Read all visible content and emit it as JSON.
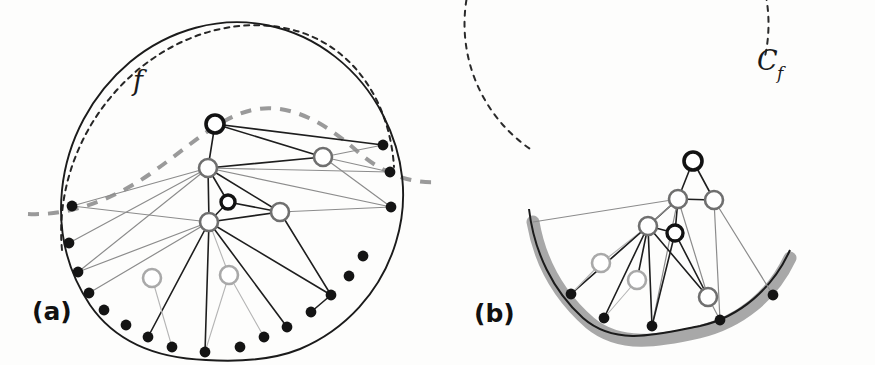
{
  "figure": {
    "width": 875,
    "height": 365,
    "background": "#fdfdfc",
    "caption_labels": {
      "panel_a": "(a)",
      "panel_b": "(b)"
    },
    "math_labels": {
      "curve_f": "f",
      "circle_c": "C",
      "circle_c_sub": "f"
    }
  },
  "colors": {
    "ink_black": "#111111",
    "node_black": "#121212",
    "node_gray_dark": "#6f6f6f",
    "node_gray_light": "#a9a9a9",
    "edge_black": "#1e1e1e",
    "edge_gray": "#8c8c8c",
    "edge_gray_light": "#b5b5b5",
    "dashed_black": "#262626",
    "dashed_gray": "#9a9a9a",
    "highlight_arc": "#a8a8a8",
    "boundary_dot": "#141414"
  },
  "panel_a": {
    "name": "closed-curve-with-internal-graph",
    "boundary_solid_path": "M 206 360 C 150 358 112 337 90 305 C 66 269 58 230 62 190 C 67 140 92 94 130 62 C 170 29 220 16 266 25 C 318 35 360 70 383 115 C 404 156 409 200 396 242 C 381 292 345 330 300 349 C 270 361 238 362 206 360 Z",
    "boundary_dots": [
      {
        "x": 72,
        "y": 206
      },
      {
        "x": 69,
        "y": 243
      },
      {
        "x": 78,
        "y": 272
      },
      {
        "x": 89,
        "y": 293
      },
      {
        "x": 104,
        "y": 310
      },
      {
        "x": 126,
        "y": 325
      },
      {
        "x": 148,
        "y": 337
      },
      {
        "x": 172,
        "y": 347
      },
      {
        "x": 205,
        "y": 352
      },
      {
        "x": 240,
        "y": 347
      },
      {
        "x": 264,
        "y": 337
      },
      {
        "x": 287,
        "y": 327
      },
      {
        "x": 311,
        "y": 312
      },
      {
        "x": 331,
        "y": 295
      },
      {
        "x": 349,
        "y": 276
      },
      {
        "x": 363,
        "y": 256
      },
      {
        "x": 391,
        "y": 207
      },
      {
        "x": 390,
        "y": 172
      },
      {
        "x": 383,
        "y": 145
      }
    ],
    "nodes": [
      {
        "id": "a1",
        "x": 215,
        "y": 124,
        "style": "black-ring",
        "r": 9
      },
      {
        "id": "a2",
        "x": 208,
        "y": 168,
        "style": "gray-ring",
        "r": 9
      },
      {
        "id": "a3",
        "x": 228,
        "y": 202,
        "style": "black-ring-small",
        "r": 7
      },
      {
        "id": "a4",
        "x": 209,
        "y": 222,
        "style": "gray-ring",
        "r": 9
      },
      {
        "id": "a5",
        "x": 323,
        "y": 157,
        "style": "gray-ring",
        "r": 9
      },
      {
        "id": "a6",
        "x": 280,
        "y": 212,
        "style": "gray-ring",
        "r": 9
      },
      {
        "id": "a7",
        "x": 152,
        "y": 278,
        "style": "lightgray-ring",
        "r": 9
      },
      {
        "id": "a8",
        "x": 229,
        "y": 275,
        "style": "lightgray-ring",
        "r": 9
      }
    ],
    "dashed_outer_curve": "M 62 250 C 56 186 82 120 132 75 C 182 30 247 15 300 32 C 356 50 390 104 394 167",
    "dashed_gray_curve": "M 28 214 C 70 216 112 200 150 174 C 190 146 218 118 252 110 C 292 101 330 127 358 152 C 382 173 410 184 438 182",
    "edges": [
      {
        "from": [
          215,
          124
        ],
        "to": [
          208,
          168
        ],
        "tone": "black"
      },
      {
        "from": [
          215,
          124
        ],
        "to": [
          323,
          157
        ],
        "tone": "black"
      },
      {
        "from": [
          215,
          124
        ],
        "to": [
          383,
          145
        ],
        "tone": "black"
      },
      {
        "from": [
          208,
          168
        ],
        "to": [
          323,
          157
        ],
        "tone": "black"
      },
      {
        "from": [
          208,
          168
        ],
        "to": [
          209,
          222
        ],
        "tone": "black"
      },
      {
        "from": [
          208,
          168
        ],
        "to": [
          228,
          202
        ],
        "tone": "black"
      },
      {
        "from": [
          208,
          168
        ],
        "to": [
          280,
          212
        ],
        "tone": "black"
      },
      {
        "from": [
          208,
          168
        ],
        "to": [
          391,
          207
        ],
        "tone": "gray"
      },
      {
        "from": [
          208,
          168
        ],
        "to": [
          390,
          172
        ],
        "tone": "gray"
      },
      {
        "from": [
          208,
          168
        ],
        "to": [
          72,
          206
        ],
        "tone": "gray"
      },
      {
        "from": [
          208,
          168
        ],
        "to": [
          69,
          243
        ],
        "tone": "gray"
      },
      {
        "from": [
          208,
          168
        ],
        "to": [
          78,
          272
        ],
        "tone": "gray"
      },
      {
        "from": [
          323,
          157
        ],
        "to": [
          383,
          145
        ],
        "tone": "gray"
      },
      {
        "from": [
          323,
          157
        ],
        "to": [
          390,
          172
        ],
        "tone": "gray"
      },
      {
        "from": [
          323,
          157
        ],
        "to": [
          391,
          207
        ],
        "tone": "gray"
      },
      {
        "from": [
          228,
          202
        ],
        "to": [
          280,
          212
        ],
        "tone": "black"
      },
      {
        "from": [
          209,
          222
        ],
        "to": [
          228,
          202
        ],
        "tone": "black"
      },
      {
        "from": [
          209,
          222
        ],
        "to": [
          280,
          212
        ],
        "tone": "black"
      },
      {
        "from": [
          280,
          212
        ],
        "to": [
          391,
          207
        ],
        "tone": "gray"
      },
      {
        "from": [
          280,
          212
        ],
        "to": [
          331,
          295
        ],
        "tone": "black"
      },
      {
        "from": [
          209,
          222
        ],
        "to": [
          331,
          295
        ],
        "tone": "black"
      },
      {
        "from": [
          209,
          222
        ],
        "to": [
          72,
          206
        ],
        "tone": "gray"
      },
      {
        "from": [
          209,
          222
        ],
        "to": [
          78,
          272
        ],
        "tone": "gray"
      },
      {
        "from": [
          209,
          222
        ],
        "to": [
          89,
          293
        ],
        "tone": "gray"
      },
      {
        "from": [
          209,
          222
        ],
        "to": [
          148,
          337
        ],
        "tone": "black"
      },
      {
        "from": [
          209,
          222
        ],
        "to": [
          205,
          352
        ],
        "tone": "black"
      },
      {
        "from": [
          209,
          222
        ],
        "to": [
          229,
          275
        ],
        "tone": "lightgray"
      },
      {
        "from": [
          209,
          222
        ],
        "to": [
          287,
          327
        ],
        "tone": "black"
      },
      {
        "from": [
          152,
          278
        ],
        "to": [
          172,
          347
        ],
        "tone": "lightgray"
      },
      {
        "from": [
          229,
          275
        ],
        "to": [
          205,
          352
        ],
        "tone": "lightgray"
      },
      {
        "from": [
          229,
          275
        ],
        "to": [
          264,
          337
        ],
        "tone": "lightgray"
      },
      {
        "from": [
          331,
          295
        ],
        "to": [
          311,
          312
        ],
        "tone": "black"
      }
    ]
  },
  "panel_b": {
    "name": "circle-with-highlighted-arc",
    "circle": {
      "cx": 678,
      "cy": 180,
      "r": 152
    },
    "dashed_start_deg": 168,
    "dashed_end_deg": 55,
    "solid_arc_path": "M 529 209 C 534 252 553 291 583 318 C 616 347 659 334 700 326 C 740 317 773 288 790 250",
    "highlight_arc_path": "M 533 222 C 540 262 560 297 590 323 C 620 348 659 341 699 332 C 740 322 772 296 790 258",
    "highlight_width": 13,
    "boundary_dots": [
      {
        "x": 571,
        "y": 294
      },
      {
        "x": 604,
        "y": 318
      },
      {
        "x": 652,
        "y": 326
      },
      {
        "x": 720,
        "y": 320
      },
      {
        "x": 773,
        "y": 295
      }
    ],
    "nodes": [
      {
        "id": "b1",
        "x": 693,
        "y": 161,
        "style": "black-ring",
        "r": 9
      },
      {
        "id": "b2",
        "x": 678,
        "y": 199,
        "style": "gray-ring",
        "r": 9
      },
      {
        "id": "b3",
        "x": 714,
        "y": 200,
        "style": "gray-ring",
        "r": 9
      },
      {
        "id": "b4",
        "x": 648,
        "y": 226,
        "style": "gray-ring",
        "r": 9
      },
      {
        "id": "b5",
        "x": 675,
        "y": 233,
        "style": "black-ring-small",
        "r": 8
      },
      {
        "id": "b6",
        "x": 601,
        "y": 263,
        "style": "lightgray-ring",
        "r": 9
      },
      {
        "id": "b7",
        "x": 637,
        "y": 280,
        "style": "lightgray-ring",
        "r": 9
      },
      {
        "id": "b8",
        "x": 708,
        "y": 297,
        "style": "gray-ring",
        "r": 9
      }
    ],
    "edges": [
      {
        "from": [
          693,
          161
        ],
        "to": [
          678,
          199
        ],
        "tone": "black"
      },
      {
        "from": [
          693,
          161
        ],
        "to": [
          714,
          200
        ],
        "tone": "black"
      },
      {
        "from": [
          678,
          199
        ],
        "to": [
          714,
          200
        ],
        "tone": "black"
      },
      {
        "from": [
          678,
          199
        ],
        "to": [
          648,
          226
        ],
        "tone": "black"
      },
      {
        "from": [
          678,
          199
        ],
        "to": [
          675,
          233
        ],
        "tone": "black"
      },
      {
        "from": [
          678,
          199
        ],
        "to": [
          708,
          297
        ],
        "tone": "gray"
      },
      {
        "from": [
          678,
          199
        ],
        "to": [
          533,
          222
        ],
        "tone": "gray"
      },
      {
        "from": [
          678,
          199
        ],
        "to": [
          571,
          294
        ],
        "tone": "gray"
      },
      {
        "from": [
          678,
          199
        ],
        "to": [
          652,
          326
        ],
        "tone": "gray"
      },
      {
        "from": [
          714,
          200
        ],
        "to": [
          773,
          295
        ],
        "tone": "gray"
      },
      {
        "from": [
          714,
          200
        ],
        "to": [
          720,
          320
        ],
        "tone": "gray"
      },
      {
        "from": [
          648,
          226
        ],
        "to": [
          675,
          233
        ],
        "tone": "black"
      },
      {
        "from": [
          648,
          226
        ],
        "to": [
          708,
          297
        ],
        "tone": "black"
      },
      {
        "from": [
          675,
          233
        ],
        "to": [
          708,
          297
        ],
        "tone": "black"
      },
      {
        "from": [
          648,
          226
        ],
        "to": [
          601,
          263
        ],
        "tone": "lightgray"
      },
      {
        "from": [
          648,
          226
        ],
        "to": [
          637,
          280
        ],
        "tone": "black"
      },
      {
        "from": [
          648,
          226
        ],
        "to": [
          571,
          294
        ],
        "tone": "black"
      },
      {
        "from": [
          648,
          226
        ],
        "to": [
          604,
          318
        ],
        "tone": "black"
      },
      {
        "from": [
          648,
          226
        ],
        "to": [
          652,
          326
        ],
        "tone": "black"
      },
      {
        "from": [
          601,
          263
        ],
        "to": [
          571,
          294
        ],
        "tone": "lightgray"
      },
      {
        "from": [
          637,
          280
        ],
        "to": [
          604,
          318
        ],
        "tone": "lightgray"
      },
      {
        "from": [
          708,
          297
        ],
        "to": [
          720,
          320
        ],
        "tone": "gray"
      },
      {
        "from": [
          675,
          233
        ],
        "to": [
          652,
          326
        ],
        "tone": "black"
      }
    ]
  }
}
